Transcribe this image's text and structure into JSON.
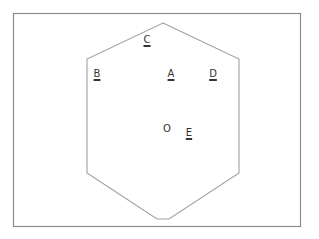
{
  "figure": {
    "frame": {
      "x": 13,
      "y": 13,
      "width": 287,
      "height": 213,
      "stroke": "#8c8c8c"
    },
    "hexagon": {
      "stroke": "#a0a0a0",
      "points": "163,23 239,59 239,173 169,219 157,219 87,173 87,59"
    },
    "labels": [
      {
        "id": "C",
        "text": "C",
        "x": 147,
        "y": 40,
        "underlined": true
      },
      {
        "id": "B",
        "text": "B",
        "x": 97,
        "y": 74,
        "underlined": true
      },
      {
        "id": "A",
        "text": "A",
        "x": 171,
        "y": 74,
        "underlined": true
      },
      {
        "id": "D",
        "text": "D",
        "x": 213,
        "y": 74,
        "underlined": true
      },
      {
        "id": "O",
        "text": "O",
        "x": 167,
        "y": 129,
        "underlined": false
      },
      {
        "id": "E",
        "text": "E",
        "x": 189,
        "y": 133,
        "underlined": true
      }
    ]
  }
}
